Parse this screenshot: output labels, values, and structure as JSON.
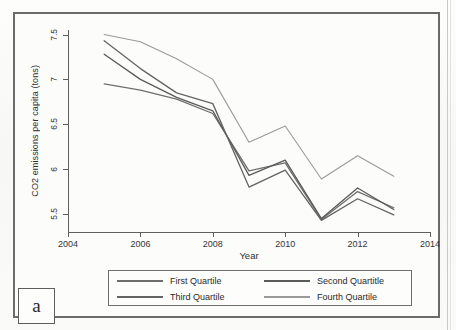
{
  "figure": {
    "panel_letter": "a",
    "background_color": "#fcfcfb",
    "frame_color": "#6b6b6b"
  },
  "axes": {
    "y_title": "CO2 emissions per capita (tons)",
    "x_title": "Year",
    "y_ticks": [
      "5.5",
      "6",
      "6.5",
      "7",
      "7.5"
    ],
    "x_ticks": [
      "2004",
      "2006",
      "2008",
      "2010",
      "2012",
      "2014"
    ]
  },
  "legend": {
    "entries": [
      {
        "label": "First Quartile",
        "color": "#6e6e6e"
      },
      {
        "label": "Second Quartitle",
        "color": "#5a5a5a"
      },
      {
        "label": "Third Quartile",
        "color": "#646464"
      },
      {
        "label": "Fourth Quartile",
        "color": "#9a9a9a"
      }
    ]
  },
  "chart_data": {
    "type": "line",
    "title": "",
    "xlabel": "Year",
    "ylabel": "CO2 emissions per capita (tons)",
    "xlim": [
      2004,
      2014
    ],
    "ylim": [
      5.3,
      7.55
    ],
    "grid": false,
    "legend_position": "below-axes",
    "x": [
      2005,
      2006,
      2007,
      2008,
      2009,
      2010,
      2011,
      2012,
      2013
    ],
    "series": [
      {
        "name": "First Quartile",
        "color": "#6e6e6e",
        "values": [
          6.95,
          6.88,
          6.78,
          6.62,
          5.98,
          6.07,
          5.44,
          5.75,
          5.57
        ]
      },
      {
        "name": "Second Quartitle",
        "color": "#5a5a5a",
        "values": [
          7.28,
          7.0,
          6.8,
          6.65,
          5.93,
          6.1,
          5.45,
          5.79,
          5.55
        ]
      },
      {
        "name": "Third Quartile",
        "color": "#646464",
        "values": [
          7.43,
          7.12,
          6.85,
          6.73,
          5.8,
          5.99,
          5.43,
          5.67,
          5.49
        ]
      },
      {
        "name": "Fourth Quartile",
        "color": "#9a9a9a",
        "values": [
          7.5,
          7.42,
          7.23,
          7.0,
          6.3,
          6.48,
          5.89,
          6.15,
          5.92
        ]
      }
    ]
  }
}
